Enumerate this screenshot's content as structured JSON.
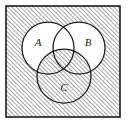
{
  "figure": {
    "kind": "venn-diagram",
    "title": "",
    "background_color": "#ffffff",
    "stroke_color": "#1a1a1a",
    "hatch_color": "#6b6b6b",
    "hatch_angle_deg": 45,
    "hatch_spacing_px": 3,
    "universe": {
      "label": "",
      "shape": "rectangle",
      "x": 6,
      "y": 6,
      "width": 114,
      "height": 111,
      "stroke_width": 1.6,
      "fill": "hatched"
    },
    "sets": [
      {
        "id": "A",
        "label": "A",
        "cx": 48,
        "cy": 48,
        "r": 26,
        "label_x": 38,
        "label_y": 46,
        "fill": "white"
      },
      {
        "id": "B",
        "label": "B",
        "cx": 79,
        "cy": 48,
        "r": 26,
        "label_x": 88,
        "label_y": 46,
        "fill": "white"
      },
      {
        "id": "C",
        "label": "C",
        "cx": 64,
        "cy": 76,
        "r": 27,
        "label_x": 64,
        "label_y": 91,
        "fill": "hatched"
      }
    ],
    "shaded_description": "complement of (A union B) within the universe rectangle, together with all of C",
    "unshaded_description": "(A union B) minus C"
  }
}
